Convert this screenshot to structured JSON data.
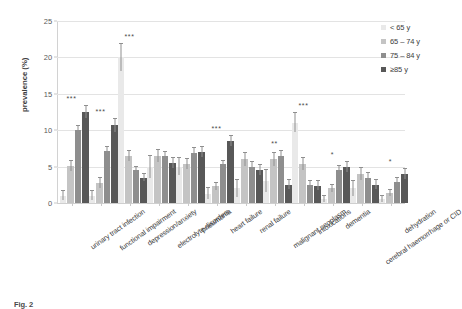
{
  "chart_data": {
    "type": "bar",
    "title": "",
    "xlabel": "",
    "ylabel": "prevalence (%)",
    "ylim": [
      0,
      25
    ],
    "yticks": [
      0,
      5,
      10,
      15,
      20,
      25
    ],
    "grid": true,
    "legend_position": "right",
    "error_bars": true,
    "categories": [
      "urinary tract infection",
      "functional impairment",
      "depression/anxiety",
      "electrolyte disorders",
      "pneumonia",
      "heart failure",
      "renal failure",
      "malignant neoplasm",
      "intoxications",
      "dementia",
      "cerebral haemorrhage or CID",
      "dehydration"
    ],
    "series": [
      {
        "name": "< 65 y",
        "color": "#e9e9e9",
        "values": [
          1.0,
          1.0,
          20.0,
          5.0,
          5.0,
          1.3,
          2.0,
          3.0,
          11.0,
          0.5,
          2.0,
          0.5
        ],
        "err_low": [
          0.6,
          0.6,
          1.8,
          1.5,
          1.2,
          0.8,
          1.2,
          1.5,
          1.3,
          0.4,
          1.0,
          0.4
        ],
        "err_high": [
          0.6,
          0.6,
          1.8,
          1.5,
          1.2,
          0.8,
          1.2,
          1.5,
          1.3,
          0.4,
          1.0,
          0.4
        ]
      },
      {
        "name": "65 – 74 y",
        "color": "#c4c4c4",
        "values": [
          5.1,
          2.8,
          6.5,
          6.5,
          5.4,
          2.3,
          6.0,
          6.0,
          5.4,
          2.0,
          4.0,
          1.4
        ],
        "err_low": [
          0.7,
          0.7,
          0.7,
          0.8,
          0.7,
          0.5,
          0.9,
          0.9,
          0.8,
          0.5,
          0.8,
          0.4
        ],
        "err_high": [
          0.7,
          0.7,
          0.7,
          0.8,
          0.7,
          0.5,
          0.9,
          0.9,
          0.8,
          0.5,
          0.8,
          0.4
        ]
      },
      {
        "name": "75 – 84 y",
        "color": "#8e8e8e",
        "values": [
          10.0,
          7.1,
          4.5,
          6.4,
          6.9,
          5.3,
          5.0,
          6.5,
          2.5,
          4.5,
          3.5,
          2.9
        ],
        "err_low": [
          0.6,
          0.6,
          0.5,
          0.6,
          0.6,
          0.5,
          0.6,
          0.7,
          0.5,
          0.6,
          0.6,
          0.5
        ],
        "err_high": [
          0.6,
          0.6,
          0.5,
          0.6,
          0.6,
          0.5,
          0.6,
          0.7,
          0.5,
          0.6,
          0.6,
          0.5
        ]
      },
      {
        "name": "≥85 y",
        "color": "#585858",
        "values": [
          12.5,
          10.7,
          3.5,
          5.5,
          7.0,
          8.5,
          4.5,
          2.5,
          2.4,
          5.0,
          2.5,
          4.0
        ],
        "err_low": [
          0.8,
          0.9,
          0.5,
          0.7,
          0.7,
          0.7,
          0.7,
          0.6,
          0.6,
          0.7,
          0.6,
          0.7
        ],
        "err_high": [
          0.8,
          0.9,
          0.5,
          0.7,
          0.7,
          0.7,
          0.7,
          0.6,
          0.6,
          0.7,
          0.6,
          0.7
        ]
      }
    ],
    "significance": [
      "***",
      "***",
      "***",
      "",
      "",
      "***",
      "",
      "**",
      "***",
      "*",
      "",
      "*"
    ]
  },
  "legend": {
    "items": [
      {
        "label": "< 65 y"
      },
      {
        "label": "65 – 74 y"
      },
      {
        "label": "75 – 84 y"
      },
      {
        "label": "≥85 y"
      }
    ]
  },
  "caption": {
    "label": "Fig. 2",
    "text": ""
  }
}
